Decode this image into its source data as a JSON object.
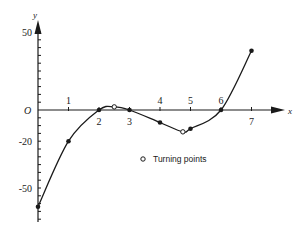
{
  "chart_data": {
    "type": "line",
    "title": "",
    "xlabel": "x",
    "ylabel": "y",
    "origin_label": "O",
    "xlim": [
      0,
      7.6
    ],
    "ylim": [
      -70,
      55
    ],
    "x_ticks": [
      1,
      2,
      3,
      4,
      5,
      6,
      7
    ],
    "x_tick_labels": [
      "1",
      "2",
      "3",
      "4",
      "5",
      "6",
      "7"
    ],
    "y_tick_labels": [
      "50",
      "-20",
      "-50"
    ],
    "y_tick_values": [
      50,
      -20,
      -50
    ],
    "grid": false,
    "series": [
      {
        "name": "curve",
        "points": [
          {
            "x": 0,
            "y": -62
          },
          {
            "x": 1,
            "y": -20
          },
          {
            "x": 2,
            "y": 0
          },
          {
            "x": 2.5,
            "y": 2
          },
          {
            "x": 3,
            "y": 0
          },
          {
            "x": 4,
            "y": -8
          },
          {
            "x": 4.75,
            "y": -14
          },
          {
            "x": 5,
            "y": -12
          },
          {
            "x": 6,
            "y": 0
          },
          {
            "x": 7,
            "y": 38
          }
        ]
      }
    ],
    "plotted_points": [
      {
        "x": 0,
        "y": -62
      },
      {
        "x": 1,
        "y": -20
      },
      {
        "x": 2,
        "y": 0
      },
      {
        "x": 3,
        "y": 0
      },
      {
        "x": 4,
        "y": -8
      },
      {
        "x": 5,
        "y": -12
      },
      {
        "x": 6,
        "y": 0
      },
      {
        "x": 7,
        "y": 38
      }
    ],
    "turning_points": [
      {
        "x": 2.5,
        "y": 2
      },
      {
        "x": 4.75,
        "y": -14
      }
    ],
    "legend": {
      "entries": [
        "Turning points"
      ],
      "position": "center-right below axis"
    }
  }
}
